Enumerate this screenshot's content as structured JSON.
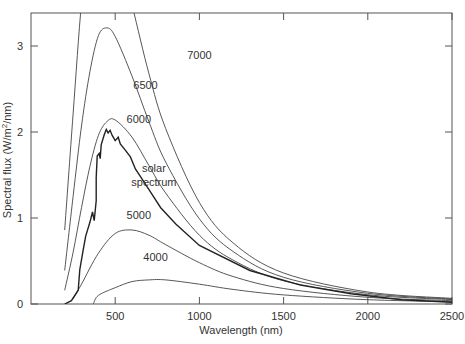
{
  "chart_data": {
    "type": "line",
    "title": "",
    "xlabel": "Wavelength (nm)",
    "ylabel": "Spectral flux (W/m²/nm)",
    "ylabel_parts": {
      "pre": "Spectral flux (W/m",
      "sup": "2",
      "post": "/nm)"
    },
    "xlim": [
      0,
      2500
    ],
    "ylim": [
      0,
      3.35
    ],
    "xticks": [
      500,
      1000,
      1500,
      2000,
      2500
    ],
    "yticks": [
      0,
      1,
      2,
      3
    ],
    "grid": false,
    "legend": "none (inline curve labels)",
    "series": [
      {
        "name": "7000",
        "kind": "blackbody",
        "x": [
          200,
          250,
          300,
          350,
          400,
          500,
          600,
          700,
          800,
          1000,
          1200,
          1500,
          2000,
          2500
        ],
        "y": [
          0.86,
          2.21,
          3.5,
          4.32,
          4.63,
          4.29,
          3.48,
          2.68,
          2.04,
          1.18,
          0.71,
          0.36,
          0.14,
          0.065
        ]
      },
      {
        "name": "6500",
        "kind": "blackbody",
        "x": [
          200,
          250,
          300,
          350,
          400,
          450,
          500,
          600,
          700,
          800,
          1000,
          1200,
          1500,
          2000,
          2500
        ],
        "y": [
          0.39,
          1.25,
          2.07,
          2.7,
          3.12,
          3.21,
          3.11,
          2.65,
          2.12,
          1.65,
          0.99,
          0.61,
          0.31,
          0.124,
          0.058
        ]
      },
      {
        "name": "6000",
        "kind": "blackbody",
        "x": [
          200,
          250,
          300,
          350,
          400,
          450,
          500,
          600,
          700,
          800,
          1000,
          1200,
          1500,
          2000,
          2500
        ],
        "y": [
          0.16,
          0.6,
          1.12,
          1.6,
          1.96,
          2.12,
          2.14,
          1.94,
          1.61,
          1.29,
          0.8,
          0.51,
          0.27,
          0.108,
          0.051
        ]
      },
      {
        "name": "5000",
        "kind": "blackbody",
        "x": [
          250,
          300,
          400,
          500,
          600,
          700,
          800,
          1000,
          1200,
          1500,
          2000,
          2500
        ],
        "y": [
          0.06,
          0.23,
          0.59,
          0.82,
          0.86,
          0.8,
          0.69,
          0.48,
          0.32,
          0.18,
          0.078,
          0.038
        ]
      },
      {
        "name": "4000",
        "kind": "blackbody",
        "x": [
          370,
          400,
          500,
          600,
          700,
          800,
          1000,
          1200,
          1500,
          2000,
          2500
        ],
        "y": [
          0.0,
          0.1,
          0.19,
          0.26,
          0.28,
          0.28,
          0.23,
          0.17,
          0.106,
          0.05,
          0.026
        ]
      },
      {
        "name": "solar spectrum",
        "kind": "measured",
        "x": [
          200,
          240,
          280,
          290,
          310,
          325,
          350,
          365,
          375,
          387,
          387,
          393,
          405,
          411,
          417,
          435,
          447,
          458,
          470,
          482,
          500,
          518,
          530,
          560,
          590,
          620,
          650,
          710,
          770,
          860,
          1000,
          1300,
          1600,
          1900,
          2200,
          2500
        ],
        "y": [
          0.0,
          0.04,
          0.16,
          0.4,
          0.63,
          0.79,
          0.95,
          1.07,
          0.97,
          1.2,
          1.47,
          1.72,
          1.75,
          1.69,
          1.85,
          1.97,
          2.03,
          1.99,
          2.02,
          1.96,
          1.9,
          1.94,
          1.86,
          1.79,
          1.71,
          1.57,
          1.48,
          1.3,
          1.12,
          0.93,
          0.68,
          0.39,
          0.22,
          0.12,
          0.05,
          0.02
        ]
      }
    ],
    "annotations": [
      {
        "text": "7000",
        "x": 1000,
        "y": 2.85
      },
      {
        "text": "6500",
        "x": 680,
        "y": 2.5
      },
      {
        "text": "6000",
        "x": 640,
        "y": 2.11
      },
      {
        "text": "solar",
        "x": 730,
        "y": 1.54
      },
      {
        "text": "spectrum",
        "x": 730,
        "y": 1.37
      },
      {
        "text": "5000",
        "x": 640,
        "y": 0.99
      },
      {
        "text": "4000",
        "x": 740,
        "y": 0.5
      }
    ]
  },
  "colors": {
    "axes": "#555555",
    "curve": "#444444",
    "solar": "#222222",
    "text": "#333333"
  }
}
